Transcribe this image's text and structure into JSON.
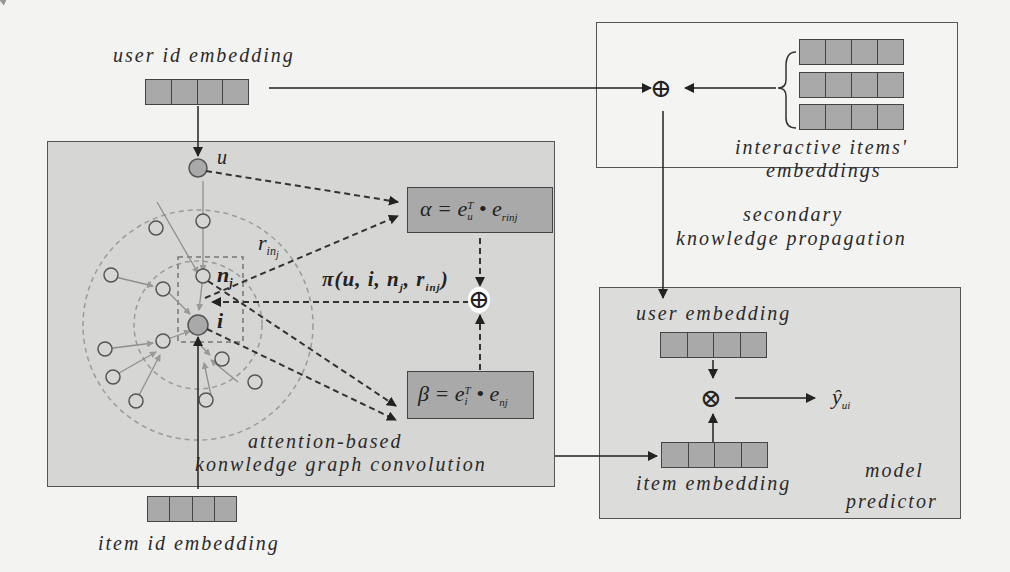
{
  "diagram": {
    "inputs": {
      "user_id_embedding": "user id embedding",
      "item_id_embedding": "item id embedding"
    },
    "kgc_panel": {
      "title_line1": "attention-based",
      "title_line2": "konwledge graph convolution",
      "nodes": {
        "user": "u",
        "item": "i",
        "neighbor": "n",
        "neighbor_sub": "j"
      },
      "relation": {
        "symbol": "r",
        "sub": "in",
        "subsub": "j"
      },
      "alpha_formula": {
        "lhs": "α = e",
        "sup": "T",
        "sub": "u",
        "dot": " • e",
        "sub2": "r",
        "sub2b": "in",
        "sub2c": "j"
      },
      "beta_formula": {
        "lhs": "β = e",
        "sup": "T",
        "sub": "i",
        "dot": " • e",
        "sub2": "nj"
      },
      "pi_label": "π(u, i, n",
      "pi_sub": "j",
      "pi_rest": ", r",
      "pi_sub2": "inj",
      "pi_close": ")",
      "combine_op": "⊕"
    },
    "secondary_panel": {
      "title_line1": "secondary",
      "title_line2": "knowledge propagation",
      "items_label_line1": "interactive items'",
      "items_label_line2": "embeddings",
      "combine_op": "⊕",
      "embedding_count": 3
    },
    "predictor_panel": {
      "title_line1": "model",
      "title_line2": "predictor",
      "user_embedding": "user embedding",
      "item_embedding": "item embedding",
      "product_op": "⊗",
      "output": "ŷ",
      "output_sub": "ui"
    },
    "colors": {
      "panel_fill": "#d6d6d4",
      "panel_white": "#f4f4f2",
      "embedding_fill": "#a9a9a9",
      "line": "#2a2a2a",
      "graph_edge": "#8a8a8a"
    }
  }
}
